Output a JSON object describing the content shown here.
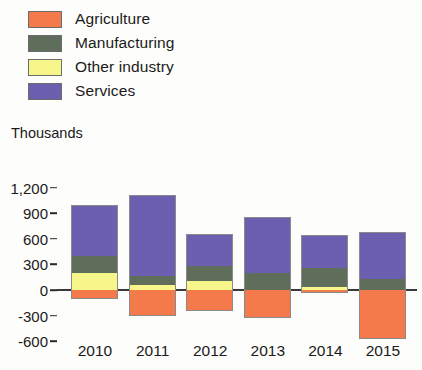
{
  "axis_title": "Thousands",
  "legend": [
    {
      "label": "Agriculture",
      "color": "#F4794B"
    },
    {
      "label": "Manufacturing",
      "color": "#5F6E5A"
    },
    {
      "label": "Other industry",
      "color": "#F7F68A"
    },
    {
      "label": "Services",
      "color": "#6D5FB0"
    }
  ],
  "chart_data": {
    "type": "bar",
    "title": "",
    "subtitle": "",
    "xlabel": "",
    "ylabel": "Thousands",
    "stacked": true,
    "grid": false,
    "legend_position": "top-left",
    "categories": [
      "2010",
      "2011",
      "2012",
      "2013",
      "2014",
      "2015"
    ],
    "ytick_labels": [
      "1,200",
      "900",
      "600",
      "300",
      "0",
      "-300",
      "-600"
    ],
    "ytick_values": [
      1200,
      900,
      600,
      300,
      0,
      -300,
      -600
    ],
    "ylim": [
      -700,
      1300
    ],
    "series": [
      {
        "name": "Agriculture",
        "color": "#F4794B",
        "values": [
          -100,
          -300,
          -250,
          -330,
          -40,
          -570
        ]
      },
      {
        "name": "Manufacturing",
        "color": "#5F6E5A",
        "values": [
          200,
          100,
          180,
          200,
          230,
          130
        ]
      },
      {
        "name": "Other industry",
        "color": "#F7F68A",
        "values": [
          200,
          60,
          100,
          0,
          30,
          0
        ]
      },
      {
        "name": "Services",
        "color": "#6D5FB0",
        "values": [
          600,
          950,
          380,
          650,
          380,
          550
        ]
      }
    ],
    "positive_totals": [
      1000,
      1110,
      660,
      850,
      640,
      680
    ],
    "negative_totals": [
      -100,
      -300,
      -250,
      -330,
      -40,
      -570
    ]
  }
}
